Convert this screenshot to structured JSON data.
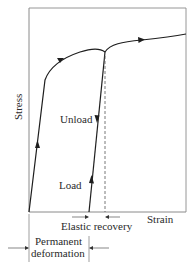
{
  "diagram": {
    "type": "stress-strain curve with unloading",
    "axes": {
      "y_label": "Stress",
      "x_label": "Strain"
    },
    "annotations": {
      "unload": "Unload",
      "load": "Load",
      "elastic_recovery": "Elastic recovery",
      "permanent_line1": "Permanent",
      "permanent_line2": "deformation"
    },
    "colors": {
      "curve": "#1e1e1e",
      "frame": "#8a8a8a",
      "dashed": "#555555",
      "text": "#2a2a2a"
    }
  }
}
